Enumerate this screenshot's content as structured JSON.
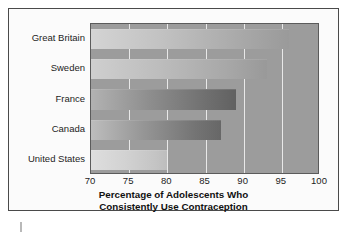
{
  "chart_data": {
    "type": "bar",
    "orientation": "horizontal",
    "title": "Percentage of Adolescents Who Consistently Use Contraception",
    "title_lines": [
      "Percentage of Adolescents Who",
      "Consistently Use Contraception"
    ],
    "xlabel": "",
    "ylabel": "",
    "categories": [
      "Great Britain",
      "Sweden",
      "France",
      "Canada",
      "United States"
    ],
    "values": [
      96,
      93,
      89,
      87,
      80
    ],
    "xlim": [
      70,
      100
    ],
    "xticks": [
      70,
      75,
      80,
      85,
      90,
      95,
      100
    ],
    "xtick_labels": [
      "70",
      "75",
      "80",
      "85",
      "90",
      "95",
      "100"
    ],
    "grid": "vertical",
    "legend": "none",
    "colors": {
      "plot_background": "#9c9c9c",
      "gridline": "#e8e8e8",
      "figure_background": "#fbfbfb",
      "frame_border": "#4a4a4a",
      "text": "#1d1d1d"
    },
    "bar_fills": [
      {
        "category": "Great Britain",
        "from": "#d4d4d4",
        "to": "#9a9a9a"
      },
      {
        "category": "Sweden",
        "from": "#cfcfcf",
        "to": "#999999"
      },
      {
        "category": "France",
        "from": "#b2b2b2",
        "to": "#616161"
      },
      {
        "category": "Canada",
        "from": "#bdbdbd",
        "to": "#676767"
      },
      {
        "category": "United States",
        "from": "#dedede",
        "to": "#bdbdbd"
      }
    ]
  }
}
